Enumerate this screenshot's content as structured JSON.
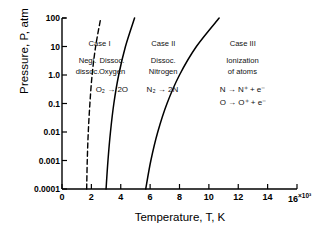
{
  "chart_data": {
    "type": "line",
    "title": "",
    "xlabel": "Temperature, T, K",
    "ylabel": "Pressure, P, atm",
    "x_exponent_label": "16",
    "x_exponent_sup": "×10³",
    "xlim": [
      0,
      16000
    ],
    "ylim": [
      0.0001,
      100
    ],
    "yscale": "log",
    "grid": false,
    "legend": "none",
    "xticks": [
      "0",
      "2",
      "4",
      "6",
      "8",
      "10",
      "12",
      "14",
      "16"
    ],
    "xtick_values": [
      0,
      2000,
      4000,
      6000,
      8000,
      10000,
      12000,
      14000,
      16000
    ],
    "yticks": [
      "100",
      "10",
      "1.0",
      "0.1",
      "0.01",
      "0.001",
      "0.0001"
    ],
    "ytick_values": [
      100,
      10,
      1.0,
      0.1,
      0.01,
      0.001,
      0.0001
    ],
    "series": [
      {
        "name": "onset-of-oxygen-dissociation",
        "style": "dashed",
        "points": [
          [
            1680,
            0.0001
          ],
          [
            1720,
            0.001
          ],
          [
            1790,
            0.01
          ],
          [
            1900,
            0.1
          ],
          [
            2050,
            1.0
          ],
          [
            2290,
            10
          ],
          [
            2640,
            100
          ]
        ]
      },
      {
        "name": "oxygen-fully-dissociated",
        "style": "solid",
        "points": [
          [
            3000,
            0.0001
          ],
          [
            3130,
            0.001
          ],
          [
            3300,
            0.01
          ],
          [
            3530,
            0.1
          ],
          [
            3860,
            1.0
          ],
          [
            4320,
            10
          ],
          [
            4940,
            100
          ]
        ]
      },
      {
        "name": "nitrogen-dissociation",
        "style": "solid",
        "points": [
          [
            5700,
            0.0001
          ],
          [
            6050,
            0.001
          ],
          [
            6520,
            0.01
          ],
          [
            7150,
            0.1
          ],
          [
            8000,
            1.0
          ],
          [
            9150,
            10
          ],
          [
            10700,
            100
          ]
        ]
      }
    ],
    "annotations": [
      {
        "name": "case-1-title",
        "text": "Case  I",
        "x": 2560,
        "y": 13.0
      },
      {
        "name": "case-1-left",
        "text": "Negl.\ndissoc.",
        "x": 1750,
        "y": 2.0
      },
      {
        "name": "case-1-right",
        "text": "Dissoc.\nOxygen",
        "x": 3400,
        "y": 2.0
      },
      {
        "name": "oxygen-reaction",
        "text": "O₂ → 2O",
        "x": 3380,
        "y": 0.3
      },
      {
        "name": "case-2-title",
        "text": "Case  II",
        "x": 6900,
        "y": 13.0
      },
      {
        "name": "case-2-sub",
        "text": "Dissoc.\nNitrogen",
        "x": 6900,
        "y": 2.0
      },
      {
        "name": "nitrogen-reaction",
        "text": "N₂ → 2N",
        "x": 6850,
        "y": 0.3
      },
      {
        "name": "case-3-title",
        "text": "Case  III",
        "x": 12300,
        "y": 13.0
      },
      {
        "name": "case-3-sub",
        "text": "Ionization\nof atoms",
        "x": 12300,
        "y": 2.0
      },
      {
        "name": "nitrogen-ionization",
        "text": "N → N⁺ + e⁻",
        "x": 12300,
        "y": 0.3
      },
      {
        "name": "oxygen-ionization",
        "text": "O → O⁺ + e⁻",
        "x": 12300,
        "y": 0.105
      }
    ]
  }
}
